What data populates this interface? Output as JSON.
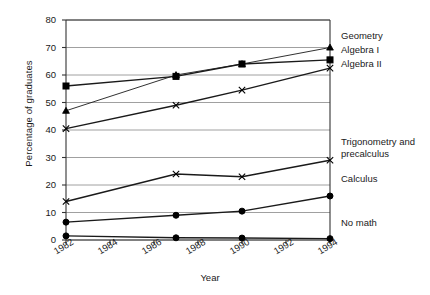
{
  "chart_data": {
    "type": "line",
    "title": "",
    "xlabel": "Year",
    "ylabel": "Percentage of graduates",
    "x": [
      1982,
      1987,
      1990,
      1994
    ],
    "xlim": [
      1982,
      1994
    ],
    "ylim": [
      0,
      80
    ],
    "xticks": [
      "1982",
      "1984",
      "1986",
      "1988",
      "1990",
      "1992",
      "1994"
    ],
    "xtick_values": [
      1982,
      1984,
      1986,
      1988,
      1990,
      1992,
      1994
    ],
    "yticks": [
      "0",
      "10",
      "20",
      "30",
      "40",
      "50",
      "60",
      "70",
      "80"
    ],
    "ytick_values": [
      0,
      10,
      20,
      30,
      40,
      50,
      60,
      70,
      80
    ],
    "grid": "horizontal",
    "legend_position": "right-inline",
    "series": [
      {
        "name": "Geometry",
        "marker": "triangle",
        "values": [
          47.0,
          60.0,
          64.0,
          70.0
        ]
      },
      {
        "name": "Algebra I",
        "marker": "square",
        "values": [
          56.0,
          59.5,
          64.0,
          65.5
        ]
      },
      {
        "name": "Algebra II",
        "marker": "x",
        "values": [
          40.5,
          49.0,
          54.5,
          62.5
        ]
      },
      {
        "name": "Trigonometry and precalculus",
        "marker": "x",
        "values": [
          14.0,
          24.0,
          23.0,
          29.0
        ]
      },
      {
        "name": "Calculus",
        "marker": "circle",
        "values": [
          6.5,
          9.0,
          10.5,
          16.0
        ]
      },
      {
        "name": "No math",
        "marker": "circle",
        "values": [
          1.5,
          0.8,
          0.7,
          0.5
        ]
      }
    ]
  },
  "legend": {
    "entries": [
      {
        "label": "Geometry"
      },
      {
        "label": "Algebra I"
      },
      {
        "label": "Algebra II"
      },
      {
        "label": "Trigonometry and precalculus"
      },
      {
        "label": "Calculus"
      },
      {
        "label": "No math"
      }
    ]
  },
  "colors": {
    "line": "#1a1a1a",
    "grid": "#888888",
    "axis": "#333333",
    "background": "#ffffff",
    "text": "#1a1a1a"
  }
}
